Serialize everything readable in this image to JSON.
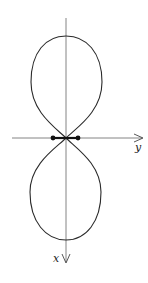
{
  "diagram": {
    "type": "polar-curve-figure-eight",
    "axes": {
      "horizontal_label": "y",
      "vertical_label": "x",
      "horizontal_direction": "right",
      "vertical_direction": "down"
    },
    "marked_points": 2,
    "colors": {
      "curve": "#2a2a2a",
      "axis": "#555555",
      "background": "#ffffff"
    }
  }
}
